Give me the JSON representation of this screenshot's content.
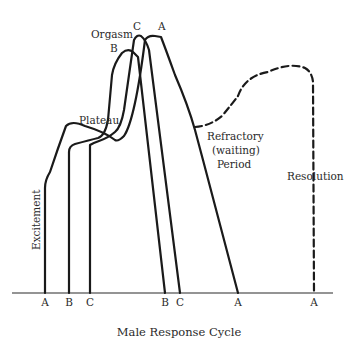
{
  "diagram": {
    "title": "Male Response Cycle",
    "phase_labels": {
      "excitement": "Excitement",
      "plateau": "Plateau",
      "orgasm": "Orgasm",
      "refractory_line1": "Refractory",
      "refractory_line2": "(waiting)",
      "refractory_line3": "Period",
      "resolution": "Resolution"
    },
    "curve_labels": {
      "peak_a": "A",
      "peak_b": "B",
      "peak_c": "C"
    },
    "x_axis_ticks": [
      {
        "label": "A",
        "x": 45
      },
      {
        "label": "B",
        "x": 69
      },
      {
        "label": "C",
        "x": 90
      },
      {
        "label": "B",
        "x": 165
      },
      {
        "label": "C",
        "x": 180
      },
      {
        "label": "A",
        "x": 238
      },
      {
        "label": "A",
        "x": 314
      }
    ],
    "colors": {
      "line": "#1a1a1a",
      "text": "#2a2a2a",
      "background": "#ffffff"
    }
  }
}
